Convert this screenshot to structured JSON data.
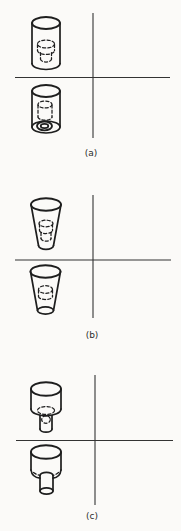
{
  "figure": {
    "background_color": "#fbfaf8",
    "line_color": "#1e1e1e",
    "axis_color": "#333333",
    "panels": [
      {
        "label": "(a)",
        "name": "straight-cylinder-pattern"
      },
      {
        "label": "(b)",
        "name": "tapered-cylinder-pattern"
      },
      {
        "label": "(c)",
        "name": "stepped-cylinder-pattern"
      }
    ]
  }
}
